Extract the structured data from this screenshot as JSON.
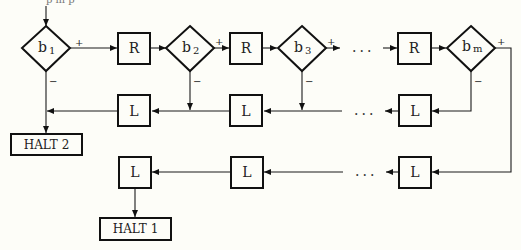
{
  "diagram": {
    "type": "flowchart",
    "top_fragment": "p   m   p",
    "decisions": [
      {
        "id": "b1",
        "base": "b",
        "sub": "1",
        "plus": "+",
        "minus": "−"
      },
      {
        "id": "b2",
        "base": "b",
        "sub": "2",
        "plus": "+",
        "minus": "−"
      },
      {
        "id": "b3",
        "base": "b",
        "sub": "3",
        "plus": "+",
        "minus": "−"
      },
      {
        "id": "bm",
        "base": "b",
        "sub": "m",
        "plus": "+",
        "minus": "−"
      }
    ],
    "right_moves": [
      {
        "id": "r1",
        "label": "R"
      },
      {
        "id": "r2",
        "label": "R"
      },
      {
        "id": "rm",
        "label": "R"
      }
    ],
    "left_moves_row1": [
      {
        "id": "l1a",
        "label": "L"
      },
      {
        "id": "l1b",
        "label": "L"
      },
      {
        "id": "l1m",
        "label": "L"
      }
    ],
    "left_moves_row2": [
      {
        "id": "l2a",
        "label": "L"
      },
      {
        "id": "l2b",
        "label": "L"
      },
      {
        "id": "l2m",
        "label": "L"
      }
    ],
    "ellipsis": "...",
    "halts": [
      {
        "id": "halt2",
        "label": "HALT 2"
      },
      {
        "id": "halt1",
        "label": "HALT 1"
      }
    ]
  }
}
